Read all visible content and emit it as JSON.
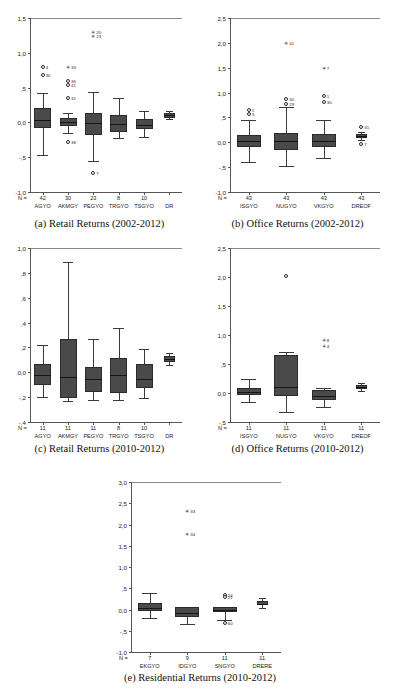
{
  "figure": {
    "kind": "boxplot-figure",
    "panel_count": 5,
    "note_decimal_separator": "comma"
  },
  "panels": [
    {
      "id": "a",
      "caption": "(a) Retail Returns (2002-2012)",
      "n_prefix": "N =",
      "chart_data": {
        "type": "boxplot",
        "title": "(a) Retail Returns (2002-2012)",
        "xlabel": "",
        "ylabel": "",
        "ylim": [
          -1.0,
          1.5
        ],
        "yticks": [
          1.5,
          1.0,
          0.5,
          0.0,
          -0.5,
          -1.0
        ],
        "ytick_labels": [
          "1,5",
          "1,0",
          ",5",
          "0,0",
          "-,5",
          "-1,0"
        ],
        "grid": false,
        "categories": [
          "AGYO",
          "AKMGY",
          "PEGYO",
          "TRGYO",
          "TSGYO",
          "DR"
        ],
        "counts": [
          "42",
          "30",
          "23",
          "8",
          "10",
          ""
        ],
        "boxes": [
          {
            "category": "AGYO",
            "whisker_low": -0.47,
            "q1": -0.08,
            "median": 0.03,
            "q3": 0.2,
            "whisker_high": 0.42,
            "outliers": [
              {
                "value": 0.79,
                "label": "4"
              },
              {
                "value": 0.68,
                "label": "30"
              }
            ],
            "extremes": []
          },
          {
            "category": "AKMGY",
            "whisker_low": -0.15,
            "q1": -0.05,
            "median": 0.01,
            "q3": 0.07,
            "whisker_high": 0.13,
            "outliers": [
              {
                "value": 0.6,
                "label": "36"
              },
              {
                "value": 0.54,
                "label": "41"
              },
              {
                "value": 0.35,
                "label": "31"
              },
              {
                "value": -0.28,
                "label": "38"
              }
            ],
            "extremes": [
              {
                "value": 0.79,
                "label": "33"
              }
            ]
          },
          {
            "category": "PEGYO",
            "whisker_low": -0.55,
            "q1": -0.18,
            "median": -0.01,
            "q3": 0.13,
            "whisker_high": 0.43,
            "outliers": [
              {
                "value": -0.73,
                "label": "7"
              }
            ],
            "extremes": [
              {
                "value": 1.3,
                "label": "20"
              },
              {
                "value": 1.24,
                "label": "23"
              }
            ]
          },
          {
            "category": "TRGYO",
            "whisker_low": -0.23,
            "q1": -0.14,
            "median": -0.02,
            "q3": 0.11,
            "whisker_high": 0.35,
            "outliers": [],
            "extremes": []
          },
          {
            "category": "TSGYO",
            "whisker_low": -0.21,
            "q1": -0.09,
            "median": -0.04,
            "q3": 0.05,
            "whisker_high": 0.17,
            "outliers": [],
            "extremes": []
          },
          {
            "category": "DR",
            "whisker_low": 0.05,
            "q1": 0.07,
            "median": 0.1,
            "q3": 0.13,
            "whisker_high": 0.17,
            "outliers": [],
            "extremes": []
          }
        ]
      }
    },
    {
      "id": "b",
      "caption": "(b) Office Returns (2002-2012)",
      "n_prefix": "N =",
      "chart_data": {
        "type": "boxplot",
        "title": "(b) Office Returns (2002-2012)",
        "xlabel": "",
        "ylabel": "",
        "ylim": [
          -1.0,
          2.5
        ],
        "yticks": [
          2.5,
          2.0,
          1.5,
          1.0,
          0.5,
          0.0,
          -0.5,
          -1.0
        ],
        "ytick_labels": [
          "2,5",
          "2,0",
          "1,5",
          "1,0",
          ",5",
          "0,0",
          "-,5",
          "-1,0"
        ],
        "grid": false,
        "categories": [
          "ISGYO",
          "NUGYO",
          "VKGYO",
          "DREOF"
        ],
        "counts": [
          "43",
          "43",
          "43",
          "43"
        ],
        "boxes": [
          {
            "category": "ISGYO",
            "whisker_low": -0.4,
            "q1": -0.09,
            "median": 0.03,
            "q3": 0.14,
            "whisker_high": 0.44,
            "outliers": [
              {
                "value": 0.64,
                "label": "1"
              },
              {
                "value": 0.57,
                "label": "3"
              }
            ],
            "extremes": []
          },
          {
            "category": "NUGYO",
            "whisker_low": -0.48,
            "q1": -0.15,
            "median": 0.02,
            "q3": 0.18,
            "whisker_high": 0.71,
            "outliers": [
              {
                "value": 0.88,
                "label": "30"
              },
              {
                "value": 0.78,
                "label": "29"
              }
            ],
            "extremes": [
              {
                "value": 2.0,
                "label": "41"
              }
            ]
          },
          {
            "category": "VKGYO",
            "whisker_low": -0.32,
            "q1": -0.1,
            "median": 0.03,
            "q3": 0.16,
            "whisker_high": 0.45,
            "outliers": [
              {
                "value": 0.93,
                "label": "1"
              },
              {
                "value": 0.82,
                "label": "30"
              }
            ],
            "extremes": [
              {
                "value": 1.49,
                "label": "7"
              }
            ]
          },
          {
            "category": "DREOF",
            "whisker_low": 0.05,
            "q1": 0.09,
            "median": 0.13,
            "q3": 0.17,
            "whisker_high": 0.21,
            "outliers": [
              {
                "value": 0.3,
                "label": "31"
              },
              {
                "value": -0.04,
                "label": "7"
              }
            ],
            "extremes": []
          }
        ]
      }
    },
    {
      "id": "c",
      "caption": "(c) Retail Returns (2010-2012)",
      "n_prefix": "N =",
      "chart_data": {
        "type": "boxplot",
        "title": "(c) Retail Returns (2010-2012)",
        "xlabel": "",
        "ylabel": "",
        "ylim": [
          -0.4,
          1.0
        ],
        "yticks": [
          1.0,
          0.8,
          0.6,
          0.4,
          0.2,
          0.0,
          -0.2,
          -0.4
        ],
        "ytick_labels": [
          "1,0",
          ",8",
          ",6",
          ",4",
          ",2",
          "0,0",
          "-,2",
          "-,4"
        ],
        "grid": false,
        "categories": [
          "AGYO",
          "AKMGY",
          "PEGYO",
          "TRGYO",
          "TSGYO",
          "DR"
        ],
        "counts": [
          "11",
          "11",
          "11",
          "8",
          "10",
          ""
        ],
        "boxes": [
          {
            "category": "AGYO",
            "whisker_low": -0.195,
            "q1": -0.105,
            "median": -0.025,
            "q3": 0.065,
            "whisker_high": 0.22,
            "outliers": [],
            "extremes": []
          },
          {
            "category": "AKMGY",
            "whisker_low": -0.23,
            "q1": -0.205,
            "median": -0.035,
            "q3": 0.265,
            "whisker_high": 0.89,
            "outliers": [],
            "extremes": []
          },
          {
            "category": "PEGYO",
            "whisker_low": -0.225,
            "q1": -0.16,
            "median": -0.05,
            "q3": 0.045,
            "whisker_high": 0.27,
            "outliers": [],
            "extremes": []
          },
          {
            "category": "TRGYO",
            "whisker_low": -0.225,
            "q1": -0.17,
            "median": -0.025,
            "q3": 0.115,
            "whisker_high": 0.355,
            "outliers": [],
            "extremes": []
          },
          {
            "category": "TSGYO",
            "whisker_low": -0.205,
            "q1": -0.125,
            "median": -0.055,
            "q3": 0.065,
            "whisker_high": 0.185,
            "outliers": [],
            "extremes": []
          },
          {
            "category": "DR",
            "whisker_low": 0.055,
            "q1": 0.08,
            "median": 0.105,
            "q3": 0.13,
            "whisker_high": 0.155,
            "outliers": [],
            "extremes": []
          }
        ]
      }
    },
    {
      "id": "d",
      "caption": "(d) Office Returns (2010-2012)",
      "n_prefix": "N =",
      "chart_data": {
        "type": "boxplot",
        "title": "(d) Office Returns (2010-2012)",
        "xlabel": "",
        "ylabel": "",
        "ylim": [
          -0.5,
          2.5
        ],
        "yticks": [
          2.5,
          2.0,
          1.5,
          1.0,
          0.5,
          0.0,
          -0.5
        ],
        "ytick_labels": [
          "2,5",
          "2,0",
          "1,5",
          "1,0",
          ",5",
          "0,0",
          "-,5"
        ],
        "grid": false,
        "categories": [
          "ISGYO",
          "NUGYO",
          "VKGYO",
          "DREOF"
        ],
        "counts": [
          "11",
          "11",
          "11",
          "11"
        ],
        "boxes": [
          {
            "category": "ISGYO",
            "whisker_low": -0.15,
            "q1": -0.035,
            "median": 0.02,
            "q3": 0.085,
            "whisker_high": 0.245,
            "outliers": [],
            "extremes": []
          },
          {
            "category": "NUGYO",
            "whisker_low": -0.32,
            "q1": -0.05,
            "median": 0.11,
            "q3": 0.65,
            "whisker_high": 0.71,
            "outliers": [
              {
                "value": 2.02,
                "label": ""
              }
            ],
            "extremes": []
          },
          {
            "category": "VKGYO",
            "whisker_low": -0.24,
            "q1": -0.115,
            "median": -0.055,
            "q3": 0.055,
            "whisker_high": 0.085,
            "outliers": [],
            "extremes": [
              {
                "value": 0.92,
                "label": "8"
              },
              {
                "value": 0.81,
                "label": "4"
              }
            ]
          },
          {
            "category": "DREOF",
            "whisker_low": 0.03,
            "q1": 0.065,
            "median": 0.105,
            "q3": 0.145,
            "whisker_high": 0.175,
            "outliers": [],
            "extremes": []
          }
        ]
      }
    },
    {
      "id": "e",
      "caption": "(e) Residential Returns (2010-2012)",
      "n_prefix": "N =",
      "chart_data": {
        "type": "boxplot",
        "title": "(e) Residential Returns (2010-2012)",
        "xlabel": "",
        "ylabel": "",
        "ylim": [
          -1.0,
          3.0
        ],
        "yticks": [
          3.0,
          2.5,
          2.0,
          1.5,
          1.0,
          0.5,
          0.0,
          -0.5,
          -1.0
        ],
        "ytick_labels": [
          "3,0",
          "2,5",
          "2,0",
          "1,5",
          "1,0",
          ",5",
          "0,0",
          "-,5",
          "-1,0"
        ],
        "grid": false,
        "categories": [
          "EKGYO",
          "IDGYO",
          "SNGYO",
          "DRERE"
        ],
        "counts": [
          "7",
          "9",
          "11",
          "11"
        ],
        "boxes": [
          {
            "category": "EKGYO",
            "whisker_low": -0.19,
            "q1": -0.04,
            "median": 0.04,
            "q3": 0.16,
            "whisker_high": 0.38,
            "outliers": [],
            "extremes": []
          },
          {
            "category": "IDGYO",
            "whisker_low": -0.33,
            "q1": -0.18,
            "median": -0.09,
            "q3": 0.05,
            "whisker_high": 0.07,
            "outliers": [],
            "extremes": [
              {
                "value": 2.32,
                "label": "33"
              },
              {
                "value": 1.78,
                "label": "34"
              }
            ]
          },
          {
            "category": "SNGYO",
            "whisker_low": -0.25,
            "q1": -0.05,
            "median": -0.01,
            "q3": 0.05,
            "whisker_high": 0.07,
            "outliers": [
              {
                "value": 0.33,
                "label": "24"
              },
              {
                "value": 0.3,
                "label": "21"
              },
              {
                "value": -0.32,
                "label": "60"
              }
            ],
            "extremes": []
          },
          {
            "category": "DRERE",
            "whisker_low": 0.04,
            "q1": 0.1,
            "median": 0.14,
            "q3": 0.19,
            "whisker_high": 0.27,
            "outliers": [],
            "extremes": []
          }
        ]
      }
    }
  ]
}
